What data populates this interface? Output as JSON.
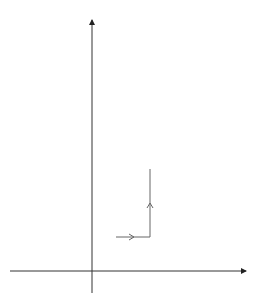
{
  "chart_data": {
    "type": "line",
    "title": "",
    "xlabel": "x",
    "ylabel": "y",
    "xlim": [
      -2.5,
      4.75
    ],
    "ylim": [
      -1.3,
      14.8
    ],
    "x_ticks": [
      -2,
      2,
      4,
      6
    ],
    "y_ticks": [
      2,
      4,
      6,
      8,
      10,
      12
    ],
    "origin_label": "O",
    "grid": true,
    "grid_step": 0.5,
    "series": [
      {
        "name": "y = x²",
        "label_text": "y = x²",
        "formula": "x^2",
        "x_range": [
          -3.16,
          3.16
        ],
        "color": "#888888",
        "stroke_width": 1
      },
      {
        "name": "y = (x − 2)²",
        "label_text": "",
        "formula": "(x-2)^2",
        "x_range": [
          -1.16,
          5.16
        ],
        "color": "#888888",
        "stroke_width": 1
      },
      {
        "name": "y = (x − 2)² + 4",
        "label_text": "y = (x − 2)² + 4",
        "formula": "(x-2)^2+4",
        "x_range": [
          -1.16,
          5.16
        ],
        "color": "#222222",
        "stroke_width": 1.4
      }
    ],
    "annotations": [
      {
        "type": "arrow",
        "from": [
          1.41,
          2
        ],
        "to": [
          3.41,
          2
        ],
        "desc": "horizontal translation by 2"
      },
      {
        "type": "arrow",
        "from": [
          3.41,
          2
        ],
        "to": [
          3.41,
          6
        ],
        "desc": "vertical translation by 4"
      }
    ]
  },
  "labels": {
    "x_axis": "x",
    "y_axis": "y",
    "origin": "O",
    "curve_base": "y = x",
    "curve_base_exp": "2",
    "curve_top_a": "y = (x − 2)",
    "curve_top_exp": "2",
    "curve_top_b": " + 4",
    "xt_m2": "−2",
    "xt_2": "2",
    "xt_4": "4",
    "xt_6": "6",
    "yt_2": "2",
    "yt_4": "4",
    "yt_6": "6",
    "yt_8": "8",
    "yt_10": "10",
    "yt_12": "12"
  }
}
